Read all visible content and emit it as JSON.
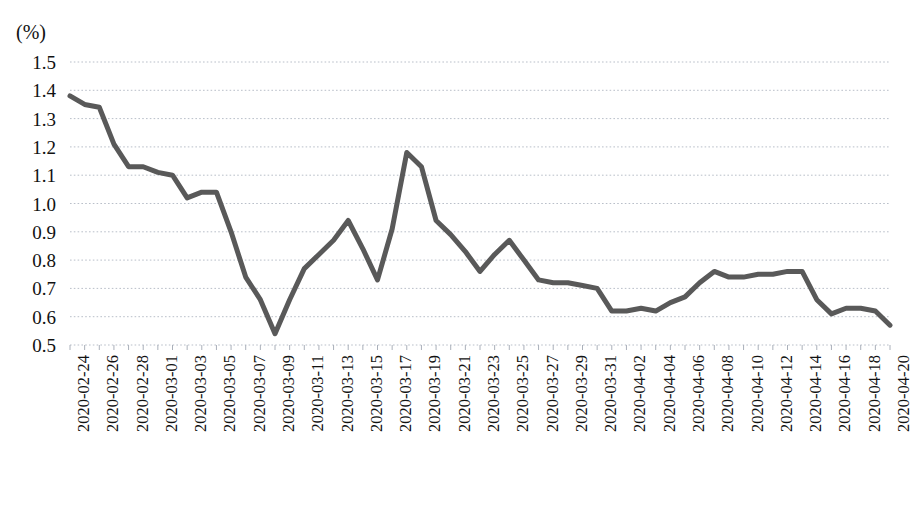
{
  "chart_data": {
    "type": "line",
    "title": "",
    "subtitle": "",
    "unit_label": "(%)",
    "xlabel": "",
    "ylabel": "",
    "ylim": [
      0.5,
      1.5
    ],
    "y_ticks": [
      "1.5",
      "1.4",
      "1.3",
      "1.2",
      "1.1",
      "1.0",
      "0.9",
      "0.8",
      "0.7",
      "0.6",
      "0.5"
    ],
    "y_tick_values": [
      1.5,
      1.4,
      1.3,
      1.2,
      1.1,
      1.0,
      0.9,
      0.8,
      0.7,
      0.6,
      0.5
    ],
    "grid": true,
    "grid_style": "dotted-horizontal",
    "legend": false,
    "legend_position": "none",
    "line_color": "#595959",
    "line_width": 5,
    "x_tick_labels": [
      "2020-02-24",
      "2020-02-26",
      "2020-02-28",
      "2020-03-01",
      "2020-03-03",
      "2020-03-05",
      "2020-03-07",
      "2020-03-09",
      "2020-03-11",
      "2020-03-13",
      "2020-03-15",
      "2020-03-17",
      "2020-03-19",
      "2020-03-21",
      "2020-03-23",
      "2020-03-25",
      "2020-03-27",
      "2020-03-29",
      "2020-03-31",
      "2020-04-02",
      "2020-04-04",
      "2020-04-06",
      "2020-04-08",
      "2020-04-10",
      "2020-04-12",
      "2020-04-14",
      "2020-04-16",
      "2020-04-18",
      "2020-04-20"
    ],
    "x": [
      "2020-02-24",
      "2020-02-25",
      "2020-02-26",
      "2020-02-27",
      "2020-02-28",
      "2020-02-29",
      "2020-03-01",
      "2020-03-02",
      "2020-03-03",
      "2020-03-04",
      "2020-03-05",
      "2020-03-06",
      "2020-03-07",
      "2020-03-08",
      "2020-03-09",
      "2020-03-10",
      "2020-03-11",
      "2020-03-12",
      "2020-03-13",
      "2020-03-14",
      "2020-03-15",
      "2020-03-16",
      "2020-03-17",
      "2020-03-18",
      "2020-03-19",
      "2020-03-20",
      "2020-03-21",
      "2020-03-22",
      "2020-03-23",
      "2020-03-24",
      "2020-03-25",
      "2020-03-26",
      "2020-03-27",
      "2020-03-28",
      "2020-03-29",
      "2020-03-30",
      "2020-03-31",
      "2020-04-01",
      "2020-04-02",
      "2020-04-03",
      "2020-04-04",
      "2020-04-05",
      "2020-04-06",
      "2020-04-07",
      "2020-04-08",
      "2020-04-09",
      "2020-04-10",
      "2020-04-11",
      "2020-04-12",
      "2020-04-13",
      "2020-04-14",
      "2020-04-15",
      "2020-04-16",
      "2020-04-17",
      "2020-04-18",
      "2020-04-19",
      "2020-04-20"
    ],
    "values": [
      1.38,
      1.35,
      1.34,
      1.21,
      1.13,
      1.13,
      1.11,
      1.1,
      1.02,
      1.04,
      1.04,
      0.9,
      0.74,
      0.66,
      0.54,
      0.66,
      0.77,
      0.82,
      0.87,
      0.94,
      0.84,
      0.73,
      0.91,
      1.18,
      1.13,
      0.94,
      0.89,
      0.83,
      0.76,
      0.82,
      0.87,
      0.8,
      0.73,
      0.72,
      0.72,
      0.71,
      0.7,
      0.62,
      0.62,
      0.63,
      0.62,
      0.65,
      0.67,
      0.72,
      0.76,
      0.74,
      0.74,
      0.75,
      0.75,
      0.76,
      0.76,
      0.66,
      0.61,
      0.63,
      0.63,
      0.62,
      0.57
    ],
    "series": [
      {
        "name": "",
        "values": [
          1.38,
          1.35,
          1.34,
          1.21,
          1.13,
          1.13,
          1.11,
          1.1,
          1.02,
          1.04,
          1.04,
          0.9,
          0.74,
          0.66,
          0.54,
          0.66,
          0.77,
          0.82,
          0.87,
          0.94,
          0.84,
          0.73,
          0.91,
          1.18,
          1.13,
          0.94,
          0.89,
          0.83,
          0.76,
          0.82,
          0.87,
          0.8,
          0.73,
          0.72,
          0.72,
          0.71,
          0.7,
          0.62,
          0.62,
          0.63,
          0.62,
          0.65,
          0.67,
          0.72,
          0.76,
          0.74,
          0.74,
          0.75,
          0.75,
          0.76,
          0.76,
          0.66,
          0.61,
          0.63,
          0.63,
          0.62,
          0.57
        ]
      }
    ]
  }
}
